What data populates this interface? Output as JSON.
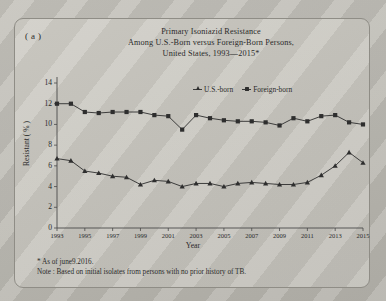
{
  "panel": {
    "label": "( a )"
  },
  "title": {
    "line1": "Primary Isoniazid Resistance",
    "line2": "Among U.S.-Born versus Foreign-Born Persons,",
    "line3": "United States, 1993—2015*"
  },
  "legend": {
    "items": [
      {
        "label": "U.S.-born",
        "marker": "triangle-marker",
        "color": "#2e2e2e"
      },
      {
        "label": "Foreign-born",
        "marker": "square-marker",
        "color": "#2e2e2e"
      }
    ]
  },
  "notes": {
    "asterisk": "*  As of june9.2016.",
    "note": "Note :  Based on initial isolates from persons with no prior history of TB."
  },
  "chart_data": {
    "type": "line",
    "title": "Primary Isoniazid Resistance Among U.S.-Born versus Foreign-Born Persons, United States, 1993—2015*",
    "xlabel": "Year",
    "ylabel": "Resistant ( % )",
    "xlim": [
      1993,
      2015
    ],
    "ylim": [
      0,
      14
    ],
    "yticks": [
      0,
      2,
      4,
      6,
      8,
      10,
      12,
      14
    ],
    "xticks": [
      1993,
      1995,
      1997,
      1999,
      2001,
      2003,
      2005,
      2007,
      2009,
      2011,
      2013,
      2015
    ],
    "grid": false,
    "legend_position": "top-right",
    "x": [
      1993,
      1994,
      1995,
      1996,
      1997,
      1998,
      1999,
      2000,
      2001,
      2002,
      2003,
      2004,
      2005,
      2006,
      2007,
      2008,
      2009,
      2010,
      2011,
      2012,
      2013,
      2014,
      2015
    ],
    "series": [
      {
        "name": "Foreign-born",
        "marker": "square",
        "color": "#2e2e2e",
        "values": [
          12.0,
          12.0,
          11.2,
          11.1,
          11.2,
          11.2,
          11.2,
          10.9,
          10.8,
          9.5,
          10.9,
          10.6,
          10.4,
          10.3,
          10.3,
          10.2,
          9.9,
          10.6,
          10.3,
          10.8,
          10.9,
          10.2,
          10.0
        ]
      },
      {
        "name": "U.S.-born",
        "marker": "triangle",
        "color": "#2e2e2e",
        "values": [
          6.7,
          6.5,
          5.5,
          5.3,
          5.0,
          4.9,
          4.2,
          4.6,
          4.5,
          4.0,
          4.3,
          4.3,
          4.0,
          4.3,
          4.4,
          4.3,
          4.2,
          4.2,
          4.4,
          5.1,
          6.0,
          7.3,
          6.3
        ]
      }
    ]
  }
}
